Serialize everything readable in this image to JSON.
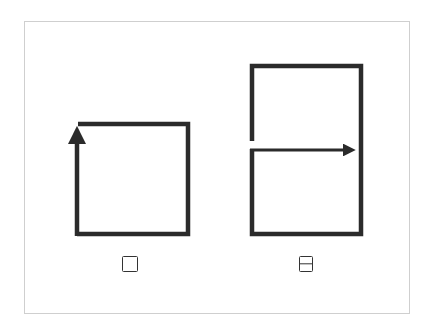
{
  "diagram": {
    "type": "stroke-order",
    "stroke_color": "#2b2b2b",
    "frame_color": "#cfcfcf",
    "figures": [
      {
        "id": "kou",
        "description": "square shape drawn as one continuous stroke, arrow marking final upward stroke on left side",
        "label_glyph": "square-icon",
        "label_text": "口"
      },
      {
        "id": "ri",
        "description": "tall rectangle with a horizontal middle stroke ending in an arrow pointing right",
        "label_glyph": "square-split-icon",
        "label_text": "日"
      }
    ]
  }
}
